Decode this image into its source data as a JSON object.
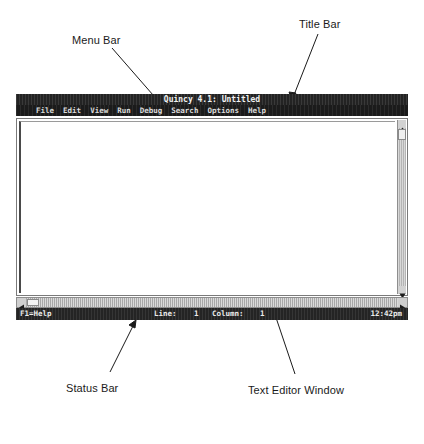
{
  "window": {
    "title": "Quincy 4.1: Untitled",
    "menu": [
      {
        "label": "File"
      },
      {
        "label": "Edit"
      },
      {
        "label": "View"
      },
      {
        "label": "Run"
      },
      {
        "label": "Debug"
      },
      {
        "label": "Search"
      },
      {
        "label": "Options"
      },
      {
        "label": "Help"
      }
    ],
    "statusbar": {
      "help": "F1=Help",
      "line_label": "Line:",
      "line_value": "1",
      "column_label": "Column:",
      "column_value": "1",
      "time": "12:42pm"
    },
    "editor": {
      "content": ""
    }
  },
  "annotations": [
    {
      "id": "menu-bar",
      "label": "Menu Bar"
    },
    {
      "id": "title-bar",
      "label": "Title Bar"
    },
    {
      "id": "scroll-buttons",
      "label": "Scroll Buttons"
    },
    {
      "id": "scroll-bars",
      "label": "Scroll Bars"
    },
    {
      "id": "scroll-boxes",
      "label": "Scroll Boxes"
    },
    {
      "id": "status-bar",
      "label": "Status Bar"
    },
    {
      "id": "text-editor-window",
      "label": "Text Editor Window"
    }
  ],
  "colors": {
    "chrome_dark": "#232323",
    "scroll_track": "#c9c9c9",
    "page_background": "#ffffff",
    "annotation_text": "#1a1a1a"
  }
}
